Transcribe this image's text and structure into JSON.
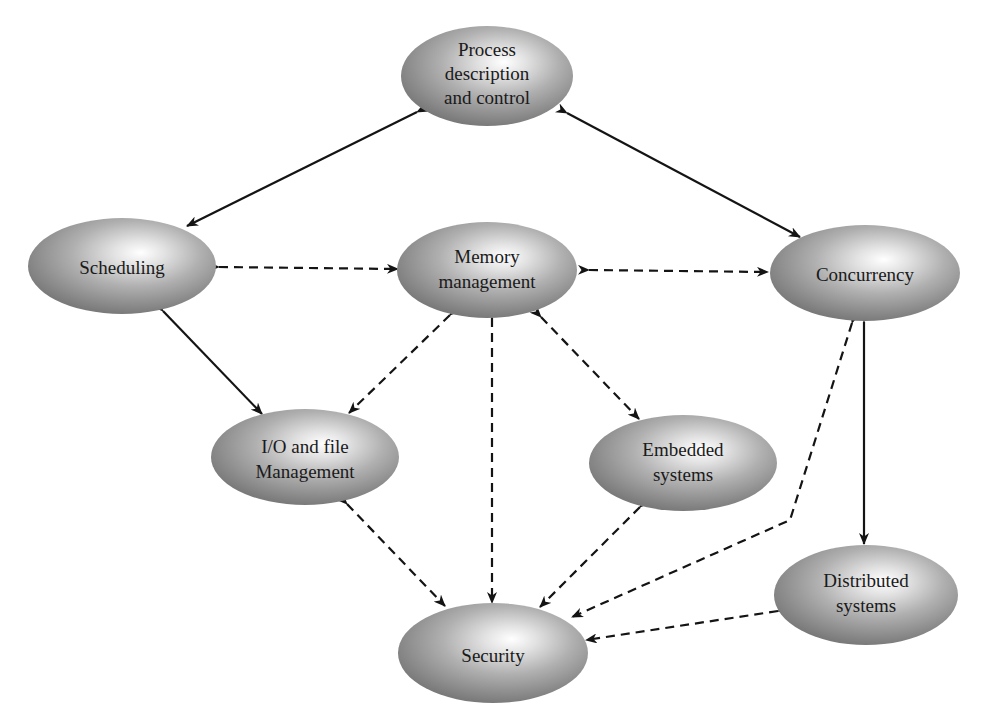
{
  "diagram": {
    "type": "concept-graph",
    "colors": {
      "node_highlight": "#ffffff",
      "node_mid": "#b8b8b8",
      "node_edge": "#7d7d7d",
      "line": "#141414",
      "background": "#ffffff"
    },
    "nodes": [
      {
        "id": "process",
        "label_lines": [
          "Process",
          "description",
          "and control"
        ],
        "cx": 487,
        "cy": 76,
        "rx": 86,
        "ry": 50
      },
      {
        "id": "scheduling",
        "label_lines": [
          "Scheduling"
        ],
        "cx": 122,
        "cy": 266,
        "rx": 94,
        "ry": 48
      },
      {
        "id": "memory",
        "label_lines": [
          "Memory",
          "management"
        ],
        "cx": 487,
        "cy": 270,
        "rx": 90,
        "ry": 48
      },
      {
        "id": "concurrency",
        "label_lines": [
          "Concurrency"
        ],
        "cx": 865,
        "cy": 273,
        "rx": 95,
        "ry": 48
      },
      {
        "id": "io",
        "label_lines": [
          "I/O and file",
          "Management"
        ],
        "cx": 305,
        "cy": 457,
        "rx": 94,
        "ry": 48
      },
      {
        "id": "embedded",
        "label_lines": [
          "Embedded",
          "systems"
        ],
        "cx": 683,
        "cy": 463,
        "rx": 94,
        "ry": 48
      },
      {
        "id": "distributed",
        "label_lines": [
          "Distributed",
          "systems"
        ],
        "cx": 866,
        "cy": 595,
        "rx": 92,
        "ry": 50
      },
      {
        "id": "security",
        "label_lines": [
          "Security"
        ],
        "cx": 493,
        "cy": 653,
        "rx": 95,
        "ry": 50
      }
    ],
    "edges": [
      {
        "from": "process",
        "to": "scheduling",
        "style": "solid",
        "direction": "both"
      },
      {
        "from": "process",
        "to": "concurrency",
        "style": "solid",
        "direction": "both"
      },
      {
        "from": "scheduling",
        "to": "memory",
        "style": "dashed",
        "direction": "both"
      },
      {
        "from": "memory",
        "to": "concurrency",
        "style": "dashed",
        "direction": "both"
      },
      {
        "from": "scheduling",
        "to": "io",
        "style": "solid",
        "direction": "both"
      },
      {
        "from": "memory",
        "to": "io",
        "style": "dashed",
        "direction": "both"
      },
      {
        "from": "memory",
        "to": "security",
        "style": "dashed",
        "direction": "both"
      },
      {
        "from": "memory",
        "to": "embedded",
        "style": "dashed",
        "direction": "both"
      },
      {
        "from": "concurrency",
        "to": "distributed",
        "style": "solid",
        "direction": "both"
      },
      {
        "from": "concurrency",
        "to": "security",
        "style": "dashed",
        "direction": "both",
        "bent": true
      },
      {
        "from": "io",
        "to": "security",
        "style": "dashed",
        "direction": "both"
      },
      {
        "from": "embedded",
        "to": "security",
        "style": "dashed",
        "direction": "both"
      },
      {
        "from": "distributed",
        "to": "security",
        "style": "dashed",
        "direction": "both"
      }
    ]
  }
}
